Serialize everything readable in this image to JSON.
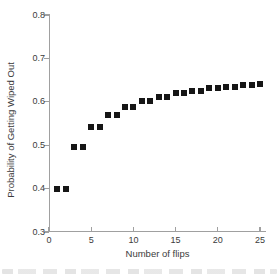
{
  "chart_data": {
    "type": "scatter",
    "title": "",
    "xlabel": "Number of flips",
    "ylabel": "Probability of Getting Wiped Out",
    "x": [
      1,
      2,
      3,
      4,
      5,
      6,
      7,
      8,
      9,
      10,
      11,
      12,
      13,
      14,
      15,
      16,
      17,
      18,
      19,
      20,
      21,
      22,
      23,
      24,
      25
    ],
    "y": [
      0.4,
      0.4,
      0.496,
      0.496,
      0.542,
      0.542,
      0.57,
      0.57,
      0.588,
      0.588,
      0.602,
      0.602,
      0.612,
      0.612,
      0.62,
      0.62,
      0.626,
      0.626,
      0.631,
      0.631,
      0.635,
      0.635,
      0.639,
      0.639,
      0.642
    ],
    "xlim": [
      0,
      25.7
    ],
    "ylim": [
      0.3,
      0.8
    ],
    "x_ticks": [
      0,
      5,
      10,
      15,
      20,
      25
    ],
    "y_ticks": [
      0.3,
      0.4,
      0.5,
      0.6,
      0.7,
      0.8
    ],
    "grid": false,
    "legend": "none",
    "marker": "filled-square",
    "marker_color": "#161616",
    "axis_color": "#a0a0a0",
    "text_color": "#3b3b3b"
  }
}
